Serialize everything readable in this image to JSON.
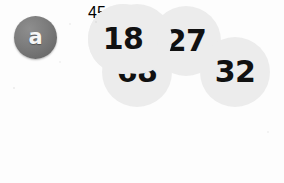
{
  "figure": {
    "label_badge": {
      "letter": "a",
      "icon": "letter-a-badge",
      "fill_color": "#7d7d7d",
      "text_color": "#f6f6f6"
    },
    "colors": {
      "background": "#fdfdfd",
      "circle_fill": "#ececec",
      "circle_stroke": "#9a9a9a",
      "square_fill": "#f4f4f4",
      "square_stroke": "#8f8f8f",
      "number_text": "#111111"
    },
    "center": {
      "shape": "square",
      "value": "45"
    },
    "ring": [
      {
        "position": "top",
        "value": "27"
      },
      {
        "position": "upper-right",
        "value": "32"
      },
      {
        "position": "lower-right",
        "value": "29"
      },
      {
        "position": "bottom",
        "value": "18"
      },
      {
        "position": "lower-left",
        "value": "74"
      },
      {
        "position": "upper-left",
        "value": "68"
      }
    ]
  }
}
